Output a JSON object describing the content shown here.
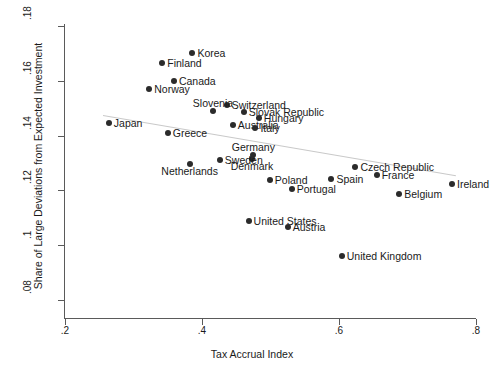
{
  "chart_data": {
    "type": "scatter",
    "title": "",
    "xlabel": "Tax Accrual Index",
    "ylabel": "Share of Large Deviations from Expected Investment",
    "xlim": [
      0.2,
      0.8
    ],
    "ylim": [
      0.08,
      0.18
    ],
    "xticks": [
      ".2",
      ".4",
      ".6",
      ".8"
    ],
    "xtick_values": [
      0.2,
      0.4,
      0.6,
      0.8
    ],
    "yticks": [
      ".08",
      ".1",
      ".12",
      ".14",
      ".16",
      ".18"
    ],
    "ytick_values": [
      0.08,
      0.1,
      0.12,
      0.14,
      0.16,
      0.18
    ],
    "grid": false,
    "legend": null,
    "marker_color": "#2b2b2b",
    "fit_line": {
      "type": "linear",
      "color": "#c9c9c9",
      "x_start": 0.255,
      "y_start": 0.1475,
      "x_end": 0.77,
      "y_end": 0.1255
    },
    "points": [
      {
        "label": "Korea",
        "x": 0.386,
        "y": 0.1703,
        "label_pos": "right"
      },
      {
        "label": "Finland",
        "x": 0.342,
        "y": 0.1664,
        "label_pos": "right"
      },
      {
        "label": "Norway",
        "x": 0.323,
        "y": 0.1569,
        "label_pos": "right"
      },
      {
        "label": "Canada",
        "x": 0.359,
        "y": 0.1598,
        "label_pos": "right"
      },
      {
        "label": "Switzerland",
        "x": 0.436,
        "y": 0.1511,
        "label_pos": "right"
      },
      {
        "label": "Slovenia",
        "x": 0.416,
        "y": 0.1489,
        "label_pos": "above"
      },
      {
        "label": "Slovak Republic",
        "x": 0.461,
        "y": 0.1486,
        "label_pos": "right"
      },
      {
        "label": "Hungary",
        "x": 0.483,
        "y": 0.1464,
        "label_pos": "right"
      },
      {
        "label": "Australia",
        "x": 0.445,
        "y": 0.144,
        "label_pos": "right"
      },
      {
        "label": "Japan",
        "x": 0.264,
        "y": 0.1446,
        "label_pos": "right"
      },
      {
        "label": "Greece",
        "x": 0.35,
        "y": 0.141,
        "label_pos": "right"
      },
      {
        "label": "Italy",
        "x": 0.478,
        "y": 0.1426,
        "label_pos": "right"
      },
      {
        "label": "Germany",
        "x": 0.475,
        "y": 0.1328,
        "label_pos": "above"
      },
      {
        "label": "Denmark",
        "x": 0.473,
        "y": 0.1314,
        "label_pos": "below"
      },
      {
        "label": "Sweden",
        "x": 0.426,
        "y": 0.131,
        "label_pos": "right"
      },
      {
        "label": "Netherlands",
        "x": 0.382,
        "y": 0.1296,
        "label_pos": "below"
      },
      {
        "label": "Poland",
        "x": 0.499,
        "y": 0.1237,
        "label_pos": "right"
      },
      {
        "label": "Portugal",
        "x": 0.531,
        "y": 0.1204,
        "label_pos": "right"
      },
      {
        "label": "Spain",
        "x": 0.589,
        "y": 0.1241,
        "label_pos": "right"
      },
      {
        "label": "Czech Republic",
        "x": 0.624,
        "y": 0.1285,
        "label_pos": "right"
      },
      {
        "label": "France",
        "x": 0.655,
        "y": 0.1256,
        "label_pos": "right"
      },
      {
        "label": "Belgium",
        "x": 0.688,
        "y": 0.1186,
        "label_pos": "right"
      },
      {
        "label": "Ireland",
        "x": 0.765,
        "y": 0.1223,
        "label_pos": "right"
      },
      {
        "label": "United States",
        "x": 0.468,
        "y": 0.1088,
        "label_pos": "right"
      },
      {
        "label": "Austria",
        "x": 0.525,
        "y": 0.1066,
        "label_pos": "right"
      },
      {
        "label": "United Kingdom",
        "x": 0.604,
        "y": 0.0959,
        "label_pos": "right"
      }
    ]
  }
}
